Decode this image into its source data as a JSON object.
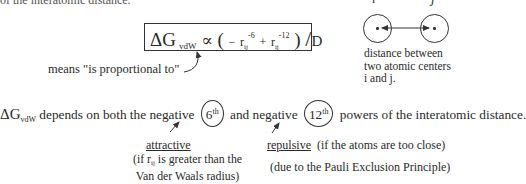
{
  "header": {
    "cut_text": "of the interatomic distance."
  },
  "formula": {
    "delta_g": "ΔG",
    "subscript": "vdW",
    "proportional_symbol": "∝",
    "open_paren": "(",
    "minus": "−",
    "r1": "r",
    "r1_sub": "ij",
    "r1_exp": "-6",
    "plus": "+",
    "r2": "r",
    "r2_sub": "ij",
    "r2_exp": "-12",
    "close_paren": ")",
    "slash": "/",
    "denominator": "D"
  },
  "annotation": {
    "means": "means \"is proportional to\""
  },
  "diagram": {
    "label_i": "i",
    "label_j": "j",
    "caption_lines": [
      "distance  between",
      "two  atomic  centers",
      "i and j."
    ]
  },
  "statement": {
    "delta_g": "ΔG",
    "subscript": "vdW",
    "part1": " depends on both the negative",
    "power6": "6",
    "power6_sup": "th",
    "part2": "and negative",
    "power12": "12",
    "power12_sup": "th",
    "part3": "powers of the interatomic distance."
  },
  "attractive": {
    "label": "attractive",
    "note_line1_pre": "(if r",
    "note_line1_sub": "ij",
    "note_line1_post": " is greater than the",
    "note_line2": "Van der Waals radius)"
  },
  "repulsive": {
    "label": "repulsive",
    "condition": "  (if the atoms are too close)",
    "note": "(due to the Pauli Exclusion Principle)"
  }
}
